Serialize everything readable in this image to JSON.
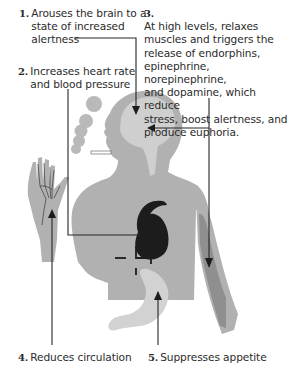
{
  "diagram": {
    "title": "",
    "colors": {
      "body": "#b1b1b1",
      "brain": "#cfcfcf",
      "stomach": "#d2d2d2",
      "heart": "#1c1c1c",
      "muscle": "#8f8f8f",
      "lines": "#262626",
      "background": "#ffffff"
    },
    "annotations": [
      {
        "number": "1.",
        "text": "Arouses the brain to a\nstate of increased\nalertness",
        "target": "brain"
      },
      {
        "number": "2.",
        "text": "Increases heart rate\nand blood pressure",
        "target": "heart"
      },
      {
        "number": "3.",
        "text": "At high levels, relaxes\nmuscles and triggers the\nrelease of endorphins,\nepinephrine, norepinephrine,\nand dopamine, which reduce\nstress, boost alertness, and\nproduce euphoria.",
        "target": "brain and arm muscle"
      },
      {
        "number": "4.",
        "text": "Reduces circulation",
        "target": "hand"
      },
      {
        "number": "5.",
        "text": "Suppresses appetite",
        "target": "stomach"
      }
    ],
    "figures": [
      "human-silhouette",
      "brain",
      "heart",
      "stomach",
      "arm-muscle",
      "hand-veins",
      "cigarette",
      "smoke"
    ]
  }
}
